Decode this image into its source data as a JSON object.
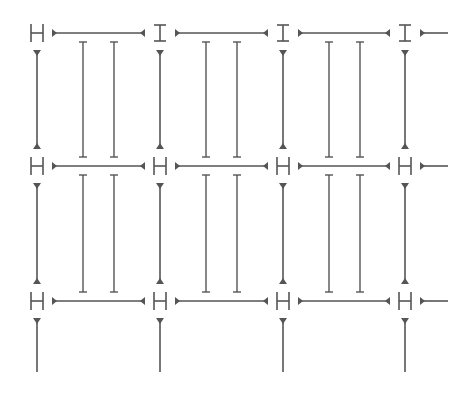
{
  "diagram": {
    "type": "grid-of-connected-nodes",
    "colors": {
      "line": "#555555",
      "background": "#ffffff"
    },
    "columns_x": [
      37,
      160,
      283,
      405
    ],
    "rows_y": [
      33,
      166,
      301
    ],
    "row_node_types": [
      [
        "H",
        "I",
        "I",
        "I"
      ],
      [
        "H",
        "H",
        "H",
        "H"
      ],
      [
        "H",
        "H",
        "H",
        "H"
      ]
    ],
    "inner_line_offsets": [
      46,
      77
    ],
    "right_stub_end_x": 448,
    "bottom_line_end_y": 372
  }
}
